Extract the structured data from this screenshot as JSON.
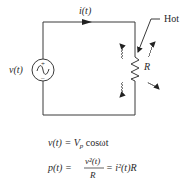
{
  "diagram": {
    "type": "circuit",
    "source_label": "v(t)",
    "current_label": "i(t)",
    "resistor_label": "R",
    "hot_label": "Hot",
    "source_plus": "+",
    "source_minus": "–",
    "equations": {
      "voltage": {
        "lhs": "v(t) = V",
        "sub": "p",
        "rhs": " cosωt"
      },
      "power": {
        "lhs": "p(t) =",
        "num": "v²(t)",
        "den": "R",
        "rhs": "= i²(t)R"
      }
    },
    "colors": {
      "line": "#3a3a3a",
      "text": "#2a2a2a",
      "background": "#ffffff"
    }
  }
}
